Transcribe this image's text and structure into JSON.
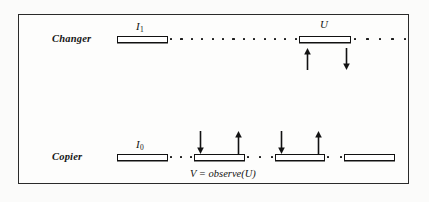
{
  "figure": {
    "border_color": "#2a2a2a",
    "background_color": "#fbfbfa",
    "ink_color": "#111111",
    "caption": "V = observe(U)"
  },
  "rows": [
    {
      "id": "changer",
      "label": "Changer",
      "label_x": 52,
      "label_y": 33,
      "line_y": 39,
      "bars": [
        {
          "name": "bar-i1",
          "x": 117,
          "width": 51
        },
        {
          "name": "bar-u",
          "x": 299,
          "width": 52
        }
      ],
      "dot_runs": [
        {
          "name": "dots-after-i1",
          "x": 170,
          "width": 127,
          "count": 13
        },
        {
          "name": "dots-after-u",
          "x": 354,
          "width": 52,
          "count": 5
        }
      ],
      "markers": [
        {
          "name": "label-i1",
          "text": "I",
          "sub": "1",
          "x": 136,
          "y": 20
        },
        {
          "name": "label-u",
          "text": "U",
          "sub": "",
          "x": 320,
          "y": 18
        }
      ],
      "arrows": [
        {
          "name": "arrow-up-receive-u",
          "direction": "up",
          "x": 303,
          "y": 48,
          "height": 22
        },
        {
          "name": "arrow-down-send-u",
          "direction": "down",
          "x": 342,
          "y": 48,
          "height": 22
        }
      ]
    },
    {
      "id": "copier",
      "label": "Copier",
      "label_x": 52,
      "label_y": 151,
      "line_y": 157,
      "bars": [
        {
          "name": "bar-i0",
          "x": 117,
          "width": 51
        },
        {
          "name": "bar-second",
          "x": 194,
          "width": 51
        },
        {
          "name": "bar-third",
          "x": 275,
          "width": 50
        },
        {
          "name": "bar-fourth",
          "x": 344,
          "width": 51
        }
      ],
      "dot_runs": [
        {
          "name": "dots-i0-second",
          "x": 170,
          "width": 22,
          "count": 3
        },
        {
          "name": "dots-second-third",
          "x": 247,
          "width": 26,
          "count": 3
        },
        {
          "name": "dots-third-fourth",
          "x": 327,
          "width": 15,
          "count": 2
        }
      ],
      "markers": [
        {
          "name": "label-i0",
          "text": "I",
          "sub": "0",
          "x": 136,
          "y": 138
        }
      ],
      "arrows": [
        {
          "name": "arrow-down-send-1",
          "direction": "down",
          "x": 196,
          "y": 131,
          "height": 23
        },
        {
          "name": "arrow-up-receive-1",
          "direction": "up",
          "x": 234,
          "y": 131,
          "height": 23
        },
        {
          "name": "arrow-down-send-2",
          "direction": "down",
          "x": 277,
          "y": 131,
          "height": 23
        },
        {
          "name": "arrow-up-receive-2",
          "direction": "up",
          "x": 314,
          "y": 131,
          "height": 23
        }
      ]
    }
  ],
  "caption_pos": {
    "x": 190,
    "y": 168
  }
}
